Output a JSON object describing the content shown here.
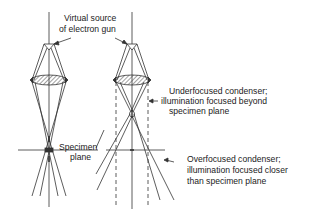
{
  "diagram": {
    "labels": {
      "virtual_source_1": "Virtual source",
      "virtual_source_2": "of electron gun",
      "underfocused_1": "Underfocused condenser;",
      "underfocused_2": "illumination focused beyond",
      "underfocused_3": "specimen plane",
      "specimen_1": "Specimen",
      "specimen_2": "plane",
      "overfocused_1": "Overfocused condenser;",
      "overfocused_2": "illumination focused closer",
      "overfocused_3": "than specimen plane"
    },
    "colors": {
      "line": "#333333",
      "background": "#ffffff"
    }
  }
}
